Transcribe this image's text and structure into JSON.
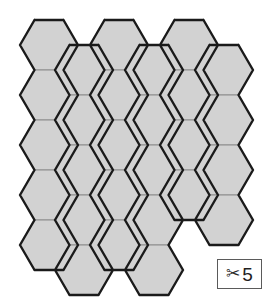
{
  "canvas": {
    "width": 272,
    "height": 305,
    "background": "#ffffff"
  },
  "board": {
    "name": "hexagon-grid",
    "description": "Flat-top hexagon tile grid shape",
    "fill_color": "#d2d2d2",
    "inner_line_color": "#8c8c8c",
    "outline_color": "#1a1a1a",
    "hex_width": 58,
    "hex_height": 50,
    "column_pitch": 70,
    "row_pitch": 50,
    "origin_x": 20,
    "origin_y": 20,
    "total_tiles": 26,
    "columns": [
      {
        "index": 0,
        "x_left": 20,
        "y_top": 20,
        "count": 5,
        "offset": 0
      },
      {
        "index": 1,
        "x_left": 55,
        "y_top": 45,
        "count": 5,
        "offset": 25
      },
      {
        "index": 2,
        "x_left": 90,
        "y_top": 20,
        "count": 5,
        "offset": 0
      },
      {
        "index": 3,
        "x_left": 125,
        "y_top": 45,
        "count": 5,
        "offset": 25
      },
      {
        "index": 4,
        "x_left": 160,
        "y_top": 20,
        "count": 4,
        "offset": 0
      },
      {
        "index": 5,
        "x_left": 195,
        "y_top": 45,
        "count": 4,
        "offset": 25
      }
    ]
  },
  "cut_badge": {
    "name": "cut-counter-badge",
    "icon": "scissors-icon",
    "icon_glyph": "✂",
    "count_label": "5",
    "border_color": "#5a5a5a",
    "background_color": "#ffffff",
    "text_color": "#1f1f1f",
    "x": 217,
    "y": 259,
    "width": 45,
    "height": 30
  }
}
